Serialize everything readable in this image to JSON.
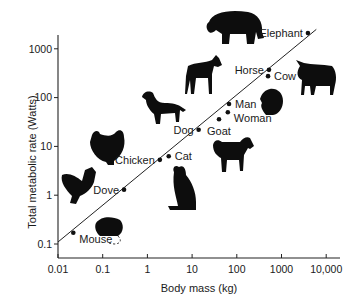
{
  "chart_data": {
    "type": "scatter",
    "title": "",
    "xlabel": "Body mass (kg)",
    "ylabel": "Total metabolic rate (Watts)",
    "xscale": "log",
    "yscale": "log",
    "xlim": [
      0.01,
      15000
    ],
    "ylim": [
      0.05,
      3000
    ],
    "xticks": [
      0.01,
      0.1,
      1,
      10,
      100,
      1000,
      10000
    ],
    "xtick_labels": [
      "0.01",
      "0.1",
      "1",
      "10",
      "100",
      "1000",
      "10,000"
    ],
    "yticks": [
      0.1,
      1,
      10,
      100,
      1000
    ],
    "ytick_labels": [
      "0.1",
      "1",
      "10",
      "100",
      "1000"
    ],
    "grid": false,
    "legend": "none",
    "points": [
      {
        "name": "Mouse",
        "x": 0.022,
        "y": 0.17,
        "label_side": "below-right"
      },
      {
        "name": "Dove",
        "x": 0.3,
        "y": 1.3,
        "label_side": "left"
      },
      {
        "name": "Chicken",
        "x": 1.9,
        "y": 5.3,
        "label_side": "left"
      },
      {
        "name": "Cat",
        "x": 3.0,
        "y": 6.3,
        "label_side": "right"
      },
      {
        "name": "Dog",
        "x": 14,
        "y": 22,
        "label_side": "left"
      },
      {
        "name": "Goat",
        "x": 40,
        "y": 36,
        "label_side": "below"
      },
      {
        "name": "Woman",
        "x": 63,
        "y": 50,
        "label_side": "below-right"
      },
      {
        "name": "Man",
        "x": 67,
        "y": 74,
        "label_side": "right"
      },
      {
        "name": "Cow",
        "x": 500,
        "y": 275,
        "label_side": "right"
      },
      {
        "name": "Horse",
        "x": 525,
        "y": 370,
        "label_side": "left"
      },
      {
        "name": "Elephant",
        "x": 3900,
        "y": 2100,
        "label_side": "left"
      }
    ],
    "fit_line": {
      "from": [
        0.01,
        0.11
      ],
      "to": [
        6000,
        2500
      ]
    },
    "silhouettes": [
      "elephant",
      "horse",
      "cow",
      "human-head",
      "dog",
      "chicken",
      "goat",
      "cat",
      "dove",
      "mouse"
    ]
  }
}
